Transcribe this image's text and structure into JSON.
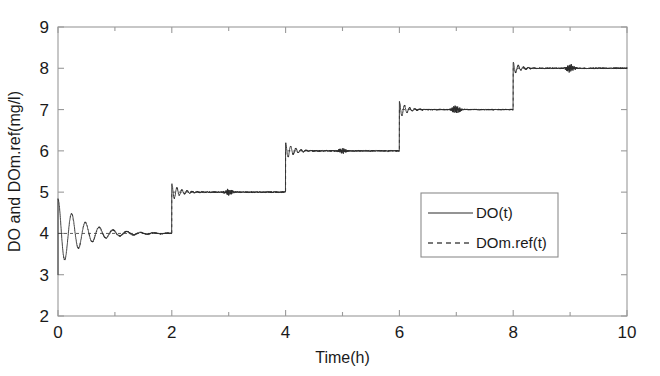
{
  "chart_data": {
    "type": "line",
    "title": "",
    "xlabel": "Time(h)",
    "ylabel": "DO and DOm.ref(mg/l)",
    "xlim": [
      0,
      10
    ],
    "ylim": [
      2,
      9
    ],
    "xticks": [
      0,
      2,
      4,
      6,
      8,
      10
    ],
    "xticklabels": [
      "0",
      "2",
      "4",
      "6",
      "8",
      "10"
    ],
    "xminorticks": [
      1,
      3,
      5,
      7,
      9
    ],
    "yticks": [
      2,
      3,
      4,
      5,
      6,
      7,
      8,
      9
    ],
    "yticklabels": [
      "2",
      "3",
      "4",
      "5",
      "6",
      "7",
      "8",
      "9"
    ],
    "grid": false,
    "legend_position": "center-right",
    "legend_entries": [
      {
        "label": "DO(t)",
        "style": "solid",
        "color": "#2b2b2b"
      },
      {
        "label": "DOm.ref(t)",
        "style": "dashed",
        "color": "#4d4d4d"
      }
    ],
    "series": [
      {
        "name": "DOm.ref(t)",
        "style": "dashed",
        "description": "Staircase reference setpoint, steps every 2 hours",
        "x": [
          0,
          2,
          2,
          4,
          4,
          6,
          6,
          8,
          8,
          10
        ],
        "values": [
          4,
          4,
          5,
          5,
          6,
          6,
          7,
          7,
          8,
          8
        ]
      },
      {
        "name": "DO(t)",
        "style": "solid",
        "description": "Measured dissolved oxygen tracking the reference with damped oscillation at t=0 and small ringing plus noise bursts after each step",
        "initial_value": 3.0,
        "steps": [
          {
            "time": 0,
            "from": 3.0,
            "to": 4.0,
            "overshoot_peak": 4.85,
            "undershoot_min": 3.15,
            "settle_time": 1.3
          },
          {
            "time": 2,
            "from": 4.0,
            "to": 5.0,
            "overshoot_peak": 5.2,
            "settle_time": 0.45
          },
          {
            "time": 4,
            "from": 5.0,
            "to": 6.0,
            "overshoot_peak": 6.2,
            "settle_time": 0.45
          },
          {
            "time": 6,
            "from": 6.0,
            "to": 7.0,
            "overshoot_peak": 7.2,
            "settle_time": 0.4
          },
          {
            "time": 8,
            "from": 7.0,
            "to": 8.0,
            "overshoot_peak": 8.15,
            "settle_time": 0.35
          }
        ],
        "noise_bursts": [
          {
            "time": 3.0,
            "amplitude": 0.07
          },
          {
            "time": 5.0,
            "amplitude": 0.06
          },
          {
            "time": 7.0,
            "amplitude": 0.1
          },
          {
            "time": 9.0,
            "amplitude": 0.1
          }
        ],
        "steady_noise_amplitude": 0.03
      }
    ]
  }
}
